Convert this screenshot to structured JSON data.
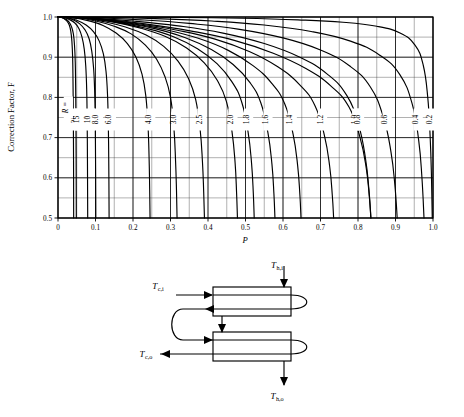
{
  "figure": {
    "kind": "lmtd-correction-factor-chart",
    "background_color": "#ffffff",
    "line_color": "#000000",
    "grid_color": "#000000"
  },
  "chart_data": {
    "type": "line",
    "title": "",
    "xlabel": "P",
    "ylabel": "Correction Factor, F",
    "xlim": [
      0.0,
      1.0
    ],
    "ylim": [
      0.5,
      1.0
    ],
    "grid": true,
    "grid_major_x": 0.1,
    "grid_major_y": 0.1,
    "grid_minor_x": 0.05,
    "grid_minor_y": 0.05,
    "legend": "inline-curve-labels",
    "legend_position": "inline",
    "xticks": [
      "0",
      "0.1",
      "0.2",
      "0.3",
      "0.4",
      "0.5",
      "0.6",
      "0.7",
      "0.8",
      "0.9",
      "1.0"
    ],
    "xtick_values": [
      0.0,
      0.1,
      0.2,
      0.3,
      0.4,
      0.5,
      0.6,
      0.7,
      0.8,
      0.9,
      1.0
    ],
    "yticks": [
      "0.5",
      "0.6",
      "0.7",
      "0.8",
      "0.9",
      "1.0"
    ],
    "ytick_values": [
      0.5,
      0.6,
      0.7,
      0.8,
      0.9,
      1.0
    ],
    "parameter_symbol": "R",
    "parameter_annotation": "R =",
    "series": [
      {
        "name": "20",
        "label": "20",
        "R": 20.0,
        "points": [
          [
            0.0,
            1.0
          ],
          [
            0.008,
            0.999
          ],
          [
            0.016,
            0.996
          ],
          [
            0.024,
            0.99
          ],
          [
            0.03,
            0.98
          ],
          [
            0.034,
            0.965
          ],
          [
            0.037,
            0.94
          ],
          [
            0.039,
            0.9
          ],
          [
            0.04,
            0.84
          ],
          [
            0.0408,
            0.76
          ],
          [
            0.0413,
            0.68
          ],
          [
            0.0416,
            0.6
          ],
          [
            0.0418,
            0.5
          ]
        ]
      },
      {
        "name": "15",
        "label": "15",
        "R": 15.0,
        "points": [
          [
            0.0,
            1.0
          ],
          [
            0.01,
            0.999
          ],
          [
            0.02,
            0.995
          ],
          [
            0.029,
            0.988
          ],
          [
            0.036,
            0.976
          ],
          [
            0.041,
            0.958
          ],
          [
            0.044,
            0.93
          ],
          [
            0.046,
            0.888
          ],
          [
            0.047,
            0.83
          ],
          [
            0.0478,
            0.75
          ],
          [
            0.0483,
            0.66
          ],
          [
            0.0486,
            0.58
          ],
          [
            0.0488,
            0.5
          ]
        ]
      },
      {
        "name": "10",
        "label": "10",
        "R": 10.0,
        "points": [
          [
            0.0,
            1.0
          ],
          [
            0.015,
            0.999
          ],
          [
            0.03,
            0.994
          ],
          [
            0.045,
            0.985
          ],
          [
            0.056,
            0.971
          ],
          [
            0.064,
            0.95
          ],
          [
            0.07,
            0.92
          ],
          [
            0.074,
            0.878
          ],
          [
            0.0765,
            0.82
          ],
          [
            0.0778,
            0.74
          ],
          [
            0.0785,
            0.65
          ],
          [
            0.0789,
            0.57
          ],
          [
            0.0792,
            0.5
          ]
        ]
      },
      {
        "name": "8.0",
        "label": "8.0",
        "R": 8.0,
        "points": [
          [
            0.0,
            1.0
          ],
          [
            0.02,
            0.999
          ],
          [
            0.04,
            0.993
          ],
          [
            0.058,
            0.983
          ],
          [
            0.072,
            0.968
          ],
          [
            0.083,
            0.946
          ],
          [
            0.09,
            0.915
          ],
          [
            0.095,
            0.872
          ],
          [
            0.0978,
            0.815
          ],
          [
            0.0993,
            0.735
          ],
          [
            0.1001,
            0.65
          ],
          [
            0.1006,
            0.57
          ],
          [
            0.1009,
            0.5
          ]
        ]
      },
      {
        "name": "6.0",
        "label": "6.0",
        "R": 6.0,
        "points": [
          [
            0.0,
            1.0
          ],
          [
            0.025,
            0.998
          ],
          [
            0.05,
            0.992
          ],
          [
            0.075,
            0.98
          ],
          [
            0.095,
            0.963
          ],
          [
            0.11,
            0.94
          ],
          [
            0.121,
            0.908
          ],
          [
            0.128,
            0.865
          ],
          [
            0.132,
            0.808
          ],
          [
            0.1342,
            0.73
          ],
          [
            0.1353,
            0.645
          ],
          [
            0.1359,
            0.568
          ],
          [
            0.1363,
            0.5
          ]
        ]
      },
      {
        "name": "4.0",
        "label": "4.0",
        "R": 4.0,
        "points": [
          [
            0.0,
            1.0
          ],
          [
            0.04,
            0.998
          ],
          [
            0.08,
            0.991
          ],
          [
            0.12,
            0.979
          ],
          [
            0.155,
            0.96
          ],
          [
            0.185,
            0.934
          ],
          [
            0.208,
            0.9
          ],
          [
            0.224,
            0.858
          ],
          [
            0.234,
            0.805
          ],
          [
            0.24,
            0.73
          ],
          [
            0.243,
            0.645
          ],
          [
            0.2445,
            0.57
          ],
          [
            0.2455,
            0.5
          ]
        ]
      },
      {
        "name": "3.0",
        "label": "3.0",
        "R": 3.0,
        "points": [
          [
            0.0,
            1.0
          ],
          [
            0.05,
            0.998
          ],
          [
            0.1,
            0.99
          ],
          [
            0.15,
            0.977
          ],
          [
            0.195,
            0.958
          ],
          [
            0.233,
            0.93
          ],
          [
            0.263,
            0.895
          ],
          [
            0.285,
            0.852
          ],
          [
            0.3,
            0.8
          ],
          [
            0.309,
            0.725
          ],
          [
            0.3135,
            0.642
          ],
          [
            0.316,
            0.568
          ],
          [
            0.3175,
            0.5
          ]
        ]
      },
      {
        "name": "2.5",
        "label": "2.5",
        "R": 2.5,
        "points": [
          [
            0.0,
            1.0
          ],
          [
            0.06,
            0.998
          ],
          [
            0.12,
            0.989
          ],
          [
            0.18,
            0.975
          ],
          [
            0.235,
            0.955
          ],
          [
            0.282,
            0.927
          ],
          [
            0.32,
            0.89
          ],
          [
            0.348,
            0.847
          ],
          [
            0.367,
            0.795
          ],
          [
            0.379,
            0.72
          ],
          [
            0.3852,
            0.64
          ],
          [
            0.3885,
            0.565
          ],
          [
            0.3905,
            0.5
          ]
        ]
      },
      {
        "name": "2.0",
        "label": "2.0",
        "R": 2.0,
        "points": [
          [
            0.0,
            1.0
          ],
          [
            0.07,
            0.997
          ],
          [
            0.145,
            0.988
          ],
          [
            0.218,
            0.973
          ],
          [
            0.285,
            0.952
          ],
          [
            0.343,
            0.923
          ],
          [
            0.39,
            0.886
          ],
          [
            0.425,
            0.842
          ],
          [
            0.449,
            0.79
          ],
          [
            0.464,
            0.715
          ],
          [
            0.4722,
            0.638
          ],
          [
            0.4762,
            0.563
          ],
          [
            0.4785,
            0.5
          ]
        ]
      },
      {
        "name": "1.8",
        "label": "1.8",
        "R": 1.8,
        "points": [
          [
            0.0,
            1.0
          ],
          [
            0.075,
            0.997
          ],
          [
            0.155,
            0.987
          ],
          [
            0.235,
            0.972
          ],
          [
            0.308,
            0.951
          ],
          [
            0.372,
            0.921
          ],
          [
            0.424,
            0.884
          ],
          [
            0.463,
            0.84
          ],
          [
            0.49,
            0.788
          ],
          [
            0.507,
            0.713
          ],
          [
            0.5162,
            0.636
          ],
          [
            0.5208,
            0.562
          ],
          [
            0.5232,
            0.5
          ]
        ]
      },
      {
        "name": "1.6",
        "label": "1.6",
        "R": 1.6,
        "points": [
          [
            0.0,
            1.0
          ],
          [
            0.082,
            0.997
          ],
          [
            0.17,
            0.986
          ],
          [
            0.258,
            0.971
          ],
          [
            0.338,
            0.949
          ],
          [
            0.409,
            0.919
          ],
          [
            0.467,
            0.882
          ],
          [
            0.511,
            0.838
          ],
          [
            0.541,
            0.786
          ],
          [
            0.56,
            0.711
          ],
          [
            0.5705,
            0.634
          ],
          [
            0.5758,
            0.56
          ],
          [
            0.5785,
            0.5
          ]
        ]
      },
      {
        "name": "1.4",
        "label": "1.4",
        "R": 1.4,
        "points": [
          [
            0.0,
            1.0
          ],
          [
            0.09,
            0.996
          ],
          [
            0.187,
            0.985
          ],
          [
            0.285,
            0.969
          ],
          [
            0.374,
            0.947
          ],
          [
            0.454,
            0.917
          ],
          [
            0.52,
            0.879
          ],
          [
            0.57,
            0.835
          ],
          [
            0.605,
            0.783
          ],
          [
            0.627,
            0.708
          ],
          [
            0.639,
            0.631
          ],
          [
            0.645,
            0.558
          ],
          [
            0.648,
            0.5
          ]
        ]
      },
      {
        "name": "1.2",
        "label": "1.2",
        "R": 1.2,
        "points": [
          [
            0.0,
            1.0
          ],
          [
            0.1,
            0.996
          ],
          [
            0.208,
            0.984
          ],
          [
            0.318,
            0.967
          ],
          [
            0.419,
            0.945
          ],
          [
            0.51,
            0.914
          ],
          [
            0.586,
            0.876
          ],
          [
            0.644,
            0.832
          ],
          [
            0.685,
            0.78
          ],
          [
            0.7105,
            0.705
          ],
          [
            0.7245,
            0.628
          ],
          [
            0.7315,
            0.556
          ],
          [
            0.735,
            0.5
          ]
        ]
      },
      {
        "name": "1.0",
        "label": "1.0",
        "R": 1.0,
        "points": [
          [
            0.0,
            1.0
          ],
          [
            0.11,
            0.995
          ],
          [
            0.232,
            0.983
          ],
          [
            0.356,
            0.965
          ],
          [
            0.47,
            0.942
          ],
          [
            0.574,
            0.91
          ],
          [
            0.661,
            0.872
          ],
          [
            0.728,
            0.828
          ],
          [
            0.776,
            0.776
          ],
          [
            0.8055,
            0.7
          ],
          [
            0.822,
            0.624
          ],
          [
            0.8302,
            0.553
          ],
          [
            0.8342,
            0.5
          ]
        ]
      },
      {
        "name": "0.8",
        "label": "0.8",
        "R": 0.8,
        "points": [
          [
            0.0,
            1.0
          ],
          [
            0.09,
            0.997
          ],
          [
            0.2,
            0.99
          ],
          [
            0.32,
            0.978
          ],
          [
            0.44,
            0.96
          ],
          [
            0.55,
            0.934
          ],
          [
            0.645,
            0.9
          ],
          [
            0.718,
            0.858
          ],
          [
            0.77,
            0.805
          ],
          [
            0.802,
            0.73
          ],
          [
            0.82,
            0.648
          ],
          [
            0.8292,
            0.57
          ],
          [
            0.8345,
            0.5
          ]
        ]
      },
      {
        "name": "0.6",
        "label": "0.6",
        "R": 0.6,
        "points": [
          [
            0.0,
            1.0
          ],
          [
            0.1,
            0.998
          ],
          [
            0.22,
            0.993
          ],
          [
            0.35,
            0.984
          ],
          [
            0.48,
            0.97
          ],
          [
            0.6,
            0.948
          ],
          [
            0.7,
            0.918
          ],
          [
            0.778,
            0.878
          ],
          [
            0.833,
            0.826
          ],
          [
            0.868,
            0.75
          ],
          [
            0.888,
            0.664
          ],
          [
            0.8985,
            0.58
          ],
          [
            0.9045,
            0.5
          ]
        ]
      },
      {
        "name": "0.4",
        "label": "0.4",
        "R": 0.4,
        "points": [
          [
            0.0,
            1.0
          ],
          [
            0.12,
            0.999
          ],
          [
            0.26,
            0.996
          ],
          [
            0.41,
            0.99
          ],
          [
            0.55,
            0.98
          ],
          [
            0.675,
            0.964
          ],
          [
            0.78,
            0.94
          ],
          [
            0.858,
            0.905
          ],
          [
            0.912,
            0.856
          ],
          [
            0.945,
            0.782
          ],
          [
            0.962,
            0.692
          ],
          [
            0.9705,
            0.6
          ],
          [
            0.976,
            0.5
          ]
        ]
      },
      {
        "name": "0.2",
        "label": "0.2",
        "R": 0.2,
        "points": [
          [
            0.0,
            1.0
          ],
          [
            0.15,
            1.0
          ],
          [
            0.32,
            0.999
          ],
          [
            0.49,
            0.997
          ],
          [
            0.64,
            0.993
          ],
          [
            0.76,
            0.987
          ],
          [
            0.85,
            0.977
          ],
          [
            0.912,
            0.96
          ],
          [
            0.952,
            0.93
          ],
          [
            0.974,
            0.88
          ],
          [
            0.986,
            0.8
          ],
          [
            0.9925,
            0.7
          ],
          [
            0.996,
            0.6
          ],
          [
            0.998,
            0.5
          ]
        ]
      }
    ]
  },
  "diagram": {
    "name": "two-shell-pass-four-tube-pass-heat-exchanger",
    "labels": {
      "hot_in": {
        "symbol": "T",
        "subscript": "h,i"
      },
      "hot_out": {
        "symbol": "T",
        "subscript": "h,o"
      },
      "cold_in": {
        "symbol": "T",
        "subscript": "c,i"
      },
      "cold_out": {
        "symbol": "T",
        "subscript": "c,o"
      }
    }
  }
}
